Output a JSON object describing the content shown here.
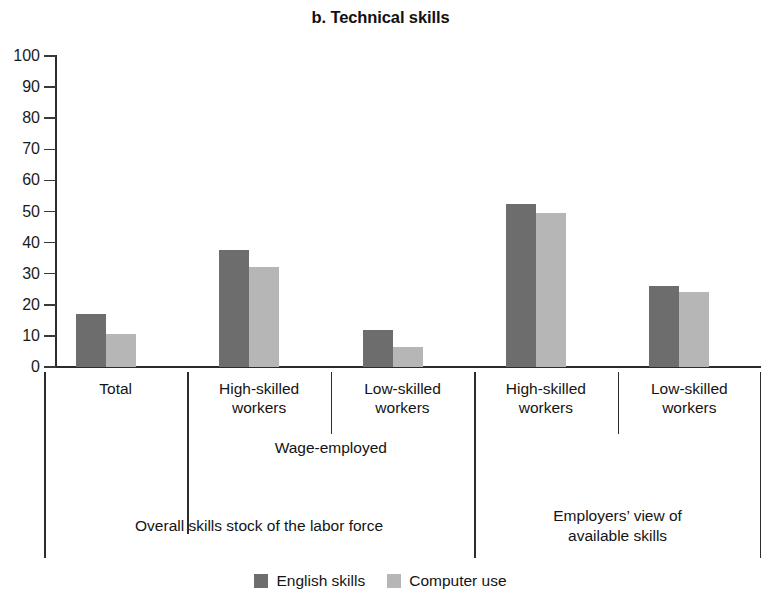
{
  "chart_data": {
    "type": "bar",
    "title": "b. Technical skills",
    "xlabel": "",
    "ylabel": "",
    "ylim": [
      0,
      100
    ],
    "yticks": [
      0,
      10,
      20,
      30,
      40,
      50,
      60,
      70,
      80,
      90,
      100
    ],
    "ytick_labels": [
      "0",
      "10",
      "20",
      "30",
      "40",
      "50",
      "60",
      "70",
      "80",
      "90",
      "100"
    ],
    "grid": false,
    "legend_position": "bottom",
    "categories": [
      "Total",
      "High-skilled workers",
      "Low-skilled workers",
      "High-skilled workers",
      "Low-skilled workers"
    ],
    "category_lines": [
      [
        "Total"
      ],
      [
        "High-skilled",
        "workers"
      ],
      [
        "Low-skilled",
        "workers"
      ],
      [
        "High-skilled",
        "workers"
      ],
      [
        "Low-skilled",
        "workers"
      ]
    ],
    "series": [
      {
        "name": "English skills",
        "color": "#6d6d6d",
        "values": [
          17,
          37.5,
          12,
          52.5,
          26
        ]
      },
      {
        "name": "Computer use",
        "color": "#b6b6b6",
        "values": [
          10.5,
          32,
          6.5,
          49.5,
          24
        ]
      }
    ],
    "group_labels_tier2": [
      {
        "label": "Wage-employed",
        "spans": [
          1,
          2
        ]
      }
    ],
    "group_labels_tier3": [
      {
        "label": "Overall skills stock of the labor force",
        "lines": [
          "Overall skills stock of the labor force"
        ],
        "spans": [
          0,
          2
        ]
      },
      {
        "label": "Employers’ view of available skills",
        "lines": [
          "Employers’ view of",
          "available skills"
        ],
        "spans": [
          3,
          4
        ]
      }
    ]
  },
  "legend": {
    "items": [
      {
        "label": "English skills",
        "color": "#6d6d6d"
      },
      {
        "label": "Computer use",
        "color": "#b6b6b6"
      }
    ]
  },
  "axis": {
    "color": "#2b2b2b"
  }
}
